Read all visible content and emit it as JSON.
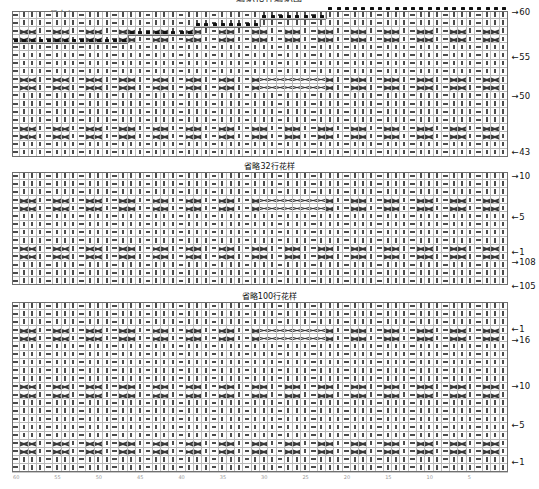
{
  "document": {
    "title": "编织花样编织图",
    "type": "knitting-stitch-chart"
  },
  "annotations": {
    "back_center_label": "后中心",
    "omit_mid": "省略32行花样",
    "omit_low": "省略100行花样"
  },
  "legend_symbols": {
    "knit": "|",
    "purl": "—",
    "cable_cross": "><",
    "cast_on": "▪"
  },
  "colors": {
    "grid_line": "#b9b9b9",
    "outline": "#6f6f6f",
    "symbol": "#4b4b4b",
    "cast_on": "#111111",
    "text": "#111111"
  },
  "sections": [
    {
      "name": "upper-yoke",
      "row_labels": [
        "60",
        "55",
        "50",
        "43"
      ],
      "rows": 18,
      "cols": 60,
      "shape": "stepped-shoulder"
    },
    {
      "name": "middle-body",
      "row_labels": [
        "10",
        "5",
        "1",
        "108",
        "105"
      ],
      "rows": 14,
      "cols": 60,
      "shape": "rectangular"
    },
    {
      "name": "lower-body",
      "row_labels": [
        "1",
        "16",
        "10",
        "5",
        "1"
      ],
      "rows": 17,
      "cols": 60,
      "shape": "rectangular"
    }
  ],
  "row_markers": {
    "upper": [
      {
        "label": "60",
        "arrow": "→"
      },
      {
        "label": "55",
        "arrow": "←"
      },
      {
        "label": "50",
        "arrow": "→"
      },
      {
        "label": "43",
        "arrow": "←"
      }
    ],
    "middle": [
      {
        "label": "10",
        "arrow": "→"
      },
      {
        "label": "5",
        "arrow": "←"
      },
      {
        "label": "1",
        "arrow": "←"
      },
      {
        "label": "108",
        "arrow": "→"
      },
      {
        "label": "105",
        "arrow": "←"
      }
    ],
    "lower": [
      {
        "label": "1",
        "arrow": "←"
      },
      {
        "label": "16",
        "arrow": "→"
      },
      {
        "label": "10",
        "arrow": "→"
      },
      {
        "label": "5",
        "arrow": "←"
      },
      {
        "label": "1",
        "arrow": "←"
      }
    ]
  },
  "chart_data": {
    "type": "table",
    "title": "编织花样编织图",
    "columns": 60,
    "cell_width_px": 8.3,
    "cell_height_px": 8.1,
    "pattern_repeat": {
      "stitch_repeat": 8,
      "row_repeat": 6,
      "unit": "— | | | — | | |"
    }
  }
}
